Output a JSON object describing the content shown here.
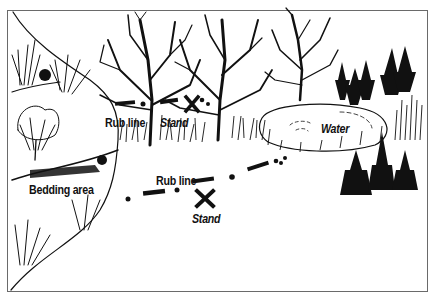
{
  "illustration": {
    "labels": {
      "rub_line_top": "Rub line",
      "stand_top": "Stand",
      "water": "Water",
      "bedding_area": "Bedding area",
      "rub_line_bottom": "Rub line",
      "stand_bottom": "Stand"
    },
    "colors": {
      "ink": "#111111",
      "frame": "#6a6a6a",
      "background": "#ffffff"
    }
  }
}
